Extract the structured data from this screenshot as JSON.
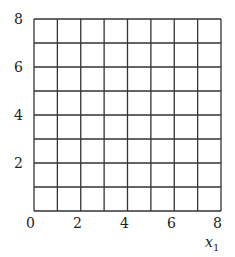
{
  "chart_data": {
    "type": "grid",
    "title": "",
    "xlabel": "x",
    "xlabel_sub": "1",
    "ylabel": "",
    "xlim": [
      0,
      8
    ],
    "ylim": [
      0,
      8
    ],
    "x_ticks": [
      "0",
      "2",
      "4",
      "6",
      "8"
    ],
    "y_ticks": [
      "2",
      "4",
      "6",
      "8"
    ],
    "grid": true,
    "grid_step": 1,
    "grid_color": "#333333",
    "series": []
  }
}
